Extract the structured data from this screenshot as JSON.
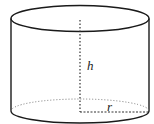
{
  "diagram": {
    "type": "cylinder",
    "labels": {
      "height": "h",
      "radius": "r"
    },
    "colors": {
      "stroke": "#1a1a1a",
      "dotted": "#777777",
      "background": "#ffffff"
    }
  }
}
